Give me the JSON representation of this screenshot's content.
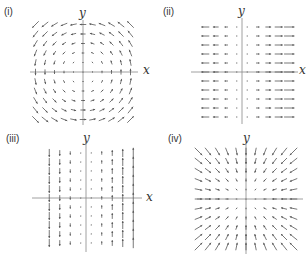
{
  "figure": {
    "panels": [
      {
        "id": "i",
        "label": "(i)",
        "x_label": "x",
        "y_label": "y",
        "field": "(-y, x)",
        "description": "counter-clockwise rotation"
      },
      {
        "id": "ii",
        "label": "(ii)",
        "x_label": "x",
        "y_label": "y",
        "field": "(x, 0)",
        "description": "horizontal outward flow"
      },
      {
        "id": "iii",
        "label": "(iii)",
        "x_label": "x",
        "y_label": "y",
        "field": "(0, x)",
        "description": "vertical shear flow"
      },
      {
        "id": "iv",
        "label": "(iv)",
        "x_label": "x",
        "y_label": "y",
        "field": "(-x, -y)",
        "description": "radial sink"
      }
    ],
    "colors": {
      "arrow": "#555555",
      "axis": "#888888",
      "text": "#333333"
    }
  }
}
